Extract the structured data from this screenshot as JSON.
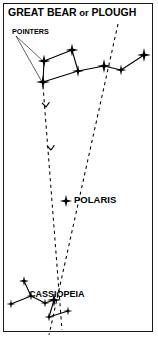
{
  "figure": {
    "kind": "star-chart",
    "background_color": "#ffffff",
    "ink_color": "#000000",
    "border_color": "#1a1a1a",
    "width": 158,
    "height": 337
  },
  "labels": {
    "title": "GREAT BEAR or PLOUGH",
    "title_main_before": "GREAT BEAR",
    "title_conjunction": " or ",
    "title_main_after": "PLOUGH",
    "pointers": "POINTERS",
    "polaris": "POLARIS",
    "cassiopeia": "CASSIOPEIA"
  },
  "chart_data": {
    "type": "scatter",
    "title": "GREAT BEAR or PLOUGH",
    "xlabel": "",
    "ylabel": "",
    "grid": false,
    "legend_position": "none",
    "xlim": [
      0,
      158
    ],
    "ylim": [
      0,
      337
    ],
    "annotations": [
      {
        "text": "GREAT BEAR or PLOUGH",
        "x": 8,
        "y": 13
      },
      {
        "text": "POINTERS",
        "x": 12,
        "y": 32
      },
      {
        "text": "POLARIS",
        "x": 74,
        "y": 202
      },
      {
        "text": "CASSIOPEIA",
        "x": 29,
        "y": 296
      }
    ],
    "constellations": [
      {
        "name": "GREAT BEAR or PLOUGH",
        "stars": [
          {
            "id": "gb1",
            "x": 43,
            "y": 82,
            "size": 7.0
          },
          {
            "id": "gb2",
            "x": 44,
            "y": 61,
            "size": 6.4
          },
          {
            "id": "gb3",
            "x": 72,
            "y": 50,
            "size": 6.4
          },
          {
            "id": "gb4",
            "x": 78,
            "y": 71,
            "size": 6.0
          },
          {
            "id": "gb5",
            "x": 104,
            "y": 66,
            "size": 7.0
          },
          {
            "id": "gb6",
            "x": 121,
            "y": 70,
            "size": 5.4
          },
          {
            "id": "gb7",
            "x": 144,
            "y": 55,
            "size": 7.0
          }
        ],
        "links": [
          [
            "gb1",
            "gb2"
          ],
          [
            "gb2",
            "gb3"
          ],
          [
            "gb3",
            "gb4"
          ],
          [
            "gb4",
            "gb1"
          ],
          [
            "gb4",
            "gb5"
          ],
          [
            "gb5",
            "gb6"
          ],
          [
            "gb6",
            "gb7"
          ]
        ]
      },
      {
        "name": "CASSIOPEIA",
        "stars": [
          {
            "id": "cs1",
            "x": 11,
            "y": 304,
            "size": 4.6
          },
          {
            "id": "cs2",
            "x": 24,
            "y": 281,
            "size": 5.0
          },
          {
            "id": "cs3",
            "x": 31,
            "y": 296,
            "size": 4.6
          },
          {
            "id": "cs4",
            "x": 45,
            "y": 303,
            "size": 4.6
          },
          {
            "id": "cs5",
            "x": 54,
            "y": 300,
            "size": 7.0
          },
          {
            "id": "cs6",
            "x": 49,
            "y": 317,
            "size": 4.6
          },
          {
            "id": "cs7",
            "x": 68,
            "y": 311,
            "size": 4.6
          }
        ],
        "links": [
          [
            "cs1",
            "cs3"
          ],
          [
            "cs3",
            "cs2"
          ],
          [
            "cs3",
            "cs4"
          ],
          [
            "cs4",
            "cs5"
          ],
          [
            "cs5",
            "cs6"
          ],
          [
            "cs6",
            "cs7"
          ]
        ]
      }
    ],
    "single_stars": [
      {
        "id": "polaris",
        "name": "POLARIS",
        "x": 66,
        "y": 201,
        "size": 6.2
      }
    ],
    "pointer_lines": [
      {
        "id": "pointer-line-left",
        "style": "dashed",
        "from": [
          43,
          86
        ],
        "to": [
          62,
          330
        ],
        "arrowheads": [
          {
            "x": 46,
            "y": 107,
            "angle": 86
          },
          {
            "x": 51,
            "y": 150,
            "angle": 86
          }
        ]
      },
      {
        "id": "pointer-line-right",
        "style": "dashed",
        "from": [
          118,
          24
        ],
        "to": [
          49,
          335
        ],
        "arrowheads": []
      }
    ],
    "leader_lines": [
      {
        "id": "leader-to-bowl-star",
        "from": [
          16,
          36
        ],
        "to": [
          44,
          62
        ]
      },
      {
        "id": "leader-to-lower-bowl-star",
        "from": [
          16,
          36
        ],
        "to": [
          42,
          82
        ]
      }
    ]
  }
}
